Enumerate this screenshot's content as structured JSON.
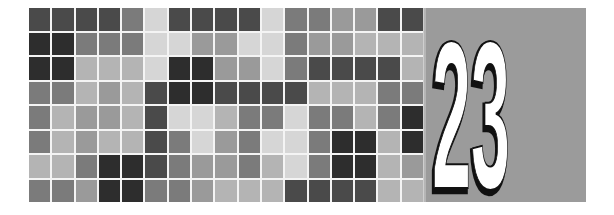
{
  "chapter": {
    "number": "23",
    "digits": [
      "2",
      "3"
    ]
  },
  "colors": {
    "panel_background": "#9b9b9b",
    "digit_fill": "#ffffff",
    "digit_shadow": "#111111",
    "grid_line": "#f4f4f4",
    "shades": {
      "vdark": "#2d2d2d",
      "dark": "#4a4a4a",
      "mid": "#7b7b7b",
      "midlight": "#9a9a9a",
      "light": "#b4b4b4",
      "vlight": "#d6d6d6"
    }
  },
  "mosaic": {
    "rows": 8,
    "cols": 17,
    "cells": [
      [
        "dark",
        "dark",
        "dark",
        "dark",
        "mid",
        "vlight",
        "dark",
        "dark",
        "dark",
        "dark",
        "vlight",
        "mid",
        "mid",
        "midlight",
        "midlight",
        "dark",
        "dark"
      ],
      [
        "vdark",
        "vdark",
        "mid",
        "mid",
        "mid",
        "vlight",
        "vlight",
        "midlight",
        "midlight",
        "vlight",
        "vlight",
        "mid",
        "midlight",
        "midlight",
        "light",
        "light",
        "light"
      ],
      [
        "vdark",
        "vdark",
        "light",
        "light",
        "light",
        "vlight",
        "vdark",
        "vdark",
        "midlight",
        "midlight",
        "vlight",
        "mid",
        "dark",
        "dark",
        "dark",
        "dark",
        "light"
      ],
      [
        "mid",
        "mid",
        "light",
        "midlight",
        "light",
        "dark",
        "vdark",
        "vdark",
        "dark",
        "dark",
        "dark",
        "dark",
        "light",
        "light",
        "light",
        "mid",
        "mid"
      ],
      [
        "mid",
        "light",
        "midlight",
        "midlight",
        "light",
        "dark",
        "vlight",
        "vlight",
        "light",
        "mid",
        "mid",
        "vlight",
        "mid",
        "mid",
        "light",
        "mid",
        "vdark"
      ],
      [
        "mid",
        "light",
        "midlight",
        "light",
        "light",
        "dark",
        "mid",
        "vlight",
        "midlight",
        "mid",
        "vlight",
        "vlight",
        "mid",
        "vdark",
        "vdark",
        "light",
        "vdark"
      ],
      [
        "light",
        "light",
        "mid",
        "vdark",
        "vdark",
        "dark",
        "mid",
        "midlight",
        "midlight",
        "mid",
        "light",
        "vlight",
        "mid",
        "vdark",
        "vdark",
        "light",
        "midlight"
      ],
      [
        "mid",
        "mid",
        "midlight",
        "vdark",
        "vdark",
        "mid",
        "mid",
        "midlight",
        "light",
        "light",
        "light",
        "dark",
        "dark",
        "dark",
        "dark",
        "light",
        "light"
      ]
    ]
  }
}
